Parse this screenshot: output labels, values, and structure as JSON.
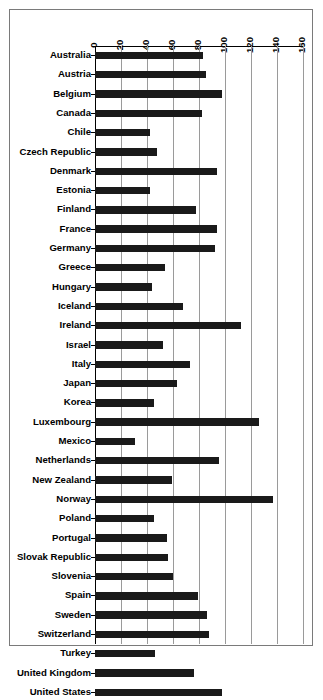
{
  "chart_data": {
    "type": "bar",
    "orientation": "horizontal",
    "title": "",
    "subtitle": "",
    "xlabel": "",
    "ylabel": "",
    "xlim": [
      0,
      160
    ],
    "xticks": [
      0,
      20,
      40,
      60,
      80,
      100,
      120,
      140,
      160
    ],
    "grid": true,
    "legend": false,
    "legend_position": "none",
    "bar_color": "#1a1a1a",
    "categories": [
      "Australia",
      "Austria",
      "Belgium",
      "Canada",
      "Chile",
      "Czech Republic",
      "Denmark",
      "Estonia",
      "Finland",
      "France",
      "Germany",
      "Greece",
      "Hungary",
      "Iceland",
      "Ireland",
      "Israel",
      "Italy",
      "Japan",
      "Korea",
      "Luxembourg",
      "Mexico",
      "Netherlands",
      "New Zealand",
      "Norway",
      "Poland",
      "Portugal",
      "Slovak Republic",
      "Slovenia",
      "Spain",
      "Sweden",
      "Switzerland",
      "Turkey",
      "United Kingdom",
      "United States"
    ],
    "values": [
      83,
      85,
      98,
      82,
      42,
      48,
      94,
      42,
      78,
      94,
      92,
      54,
      44,
      68,
      112,
      52,
      73,
      63,
      45,
      126,
      31,
      95,
      59,
      137,
      45,
      55,
      56,
      60,
      79,
      86,
      88,
      46,
      76,
      98
    ]
  }
}
